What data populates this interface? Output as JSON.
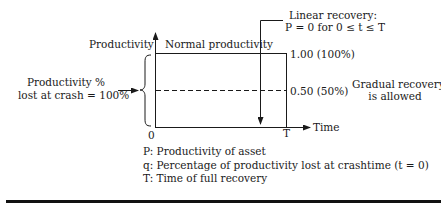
{
  "diagram": {
    "y_axis_label": "Productivity",
    "x_axis_label": "Time",
    "origin_label": "0",
    "t_label": "T",
    "normal_label": "Normal productivity",
    "level_full_label": "1.00 (100%)",
    "level_half_label": "0.50 (50%)",
    "lost_label_line1": "Productivity %",
    "lost_label_line2": "lost at crash = 100%",
    "linear_recovery_line1": "Linear recovery:",
    "linear_recovery_line2": "P = 0 for 0 ≤ t ≤ T",
    "gradual_line1": "Gradual recovery",
    "gradual_line2": "is allowed"
  },
  "legend": {
    "items": [
      "P: Productivity of asset",
      "q: Percentage of productivity lost at crashtime (t = 0)",
      "T: Time of full recovery"
    ]
  },
  "colors": {
    "line": "#1a1a1a",
    "background": "#ffffff"
  }
}
